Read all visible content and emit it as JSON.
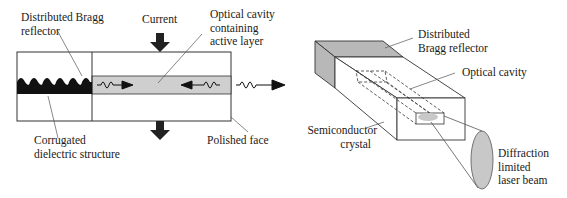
{
  "left_diagram": {
    "labels": {
      "dbr": [
        "Distributed Bragg",
        "reflector"
      ],
      "current": "Current",
      "cavity": [
        "Optical cavity",
        "containing",
        "active layer"
      ],
      "corrugated": [
        "Corrugated",
        "dielectric structure"
      ],
      "polished": "Polished face"
    }
  },
  "right_diagram": {
    "labels": {
      "dbr": [
        "Distributed",
        "Bragg reflector"
      ],
      "cavity": "Optical cavity",
      "crystal": [
        "Semiconductor",
        "crystal"
      ],
      "beam": [
        "Diffraction",
        "limited",
        "laser beam"
      ]
    }
  },
  "colors": {
    "line": "#222222",
    "gray_fill": "#cfcfcf",
    "dbr_fill": "#b8b8b8",
    "beam_fill": "#c8c8c8",
    "black": "#111111"
  }
}
